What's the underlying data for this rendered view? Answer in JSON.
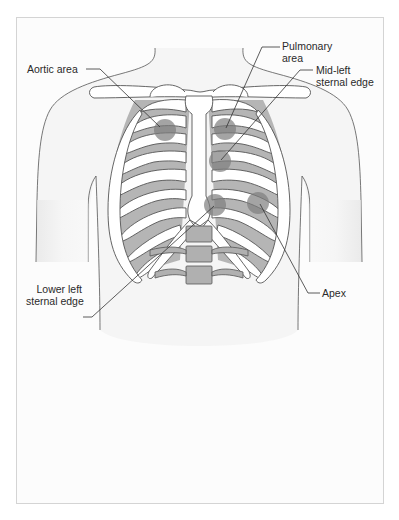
{
  "figure": {
    "colors": {
      "background": "#ffffff",
      "frame_border": "#d4d4d4",
      "skin_fill": "#f4f4f4",
      "outline": "#4a4a4a",
      "bone_fill": "#ffffff",
      "intercostal_fill": "#b3b3b3",
      "marker_fill": "#8c8c8c",
      "label_text": "#2a2a2a"
    },
    "labels": [
      {
        "id": "aortic",
        "text": "Aortic area"
      },
      {
        "id": "pulmonary",
        "line1": "Pulmonary",
        "line2": "area"
      },
      {
        "id": "mid_left",
        "line1": "Mid-left",
        "line2": "sternal edge"
      },
      {
        "id": "lower_left",
        "line1": "Lower left",
        "line2": "sternal edge"
      },
      {
        "id": "apex",
        "text": "Apex"
      }
    ],
    "markers": [
      {
        "id": "aortic",
        "cx": 165,
        "cy": 130,
        "r": 11
      },
      {
        "id": "pulmonary",
        "cx": 225,
        "cy": 129,
        "r": 11
      },
      {
        "id": "mid_left",
        "cx": 220,
        "cy": 161,
        "r": 11
      },
      {
        "id": "lower_left",
        "cx": 215,
        "cy": 205,
        "r": 11
      },
      {
        "id": "apex",
        "cx": 258,
        "cy": 203,
        "r": 11
      }
    ]
  }
}
